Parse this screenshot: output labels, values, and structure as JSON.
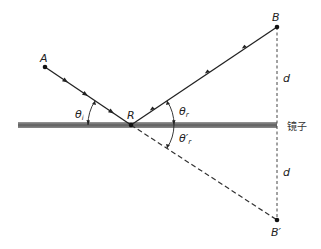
{
  "diagram": {
    "title": "",
    "points": {
      "A": {
        "label": "A",
        "x": 45,
        "y": 67
      },
      "R": {
        "label": "R",
        "x": 131,
        "y": 125
      },
      "B": {
        "label": "B",
        "x": 277,
        "y": 27
      },
      "B_prime": {
        "label": "B′",
        "x": 277,
        "y": 220
      }
    },
    "angles": {
      "incident": "θi",
      "incident_base": "θ",
      "incident_sub": "i",
      "reflected": "θr",
      "reflected_base": "θ",
      "reflected_sub": "r",
      "reflected_prime": "θ′r",
      "reflected_prime_base": "θ′",
      "reflected_prime_sub": "r"
    },
    "distances": {
      "upper": "d",
      "lower": "d"
    },
    "mirror": {
      "label": "镜子",
      "color": "#6e6e6e"
    },
    "colors": {
      "ray": "#222222",
      "dashed": "#444444",
      "background": "#ffffff"
    }
  }
}
